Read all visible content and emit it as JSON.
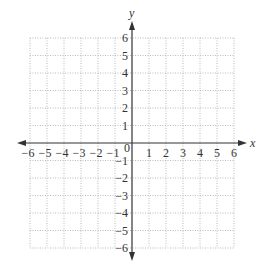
{
  "chart_data": {
    "type": "scatter",
    "title": "",
    "xlabel": "x",
    "ylabel": "y",
    "xlim": [
      -6,
      6
    ],
    "ylim": [
      -6,
      6
    ],
    "grid": true,
    "grid_style": "dotted",
    "x_ticks": [
      -6,
      -5,
      -4,
      -3,
      -2,
      -1,
      0,
      1,
      2,
      3,
      4,
      5,
      6
    ],
    "y_ticks": [
      -6,
      -5,
      -4,
      -3,
      -2,
      -1,
      1,
      2,
      3,
      4,
      5,
      6
    ],
    "x_tick_labels": [
      "−6",
      "−5",
      "−4",
      "−3",
      "−2",
      "−1",
      "0",
      "1",
      "2",
      "3",
      "4",
      "5",
      "6"
    ],
    "y_tick_labels": [
      "−6",
      "−5",
      "−4",
      "−3",
      "−2",
      "−1",
      "1",
      "2",
      "3",
      "4",
      "5",
      "6"
    ],
    "series": [],
    "legend": null
  },
  "axes": {
    "x_name": "x",
    "y_name": "y",
    "origin_label": "0"
  },
  "colors": {
    "axis": "#333333",
    "grid": "#a9a9a9",
    "background": "#ffffff"
  }
}
